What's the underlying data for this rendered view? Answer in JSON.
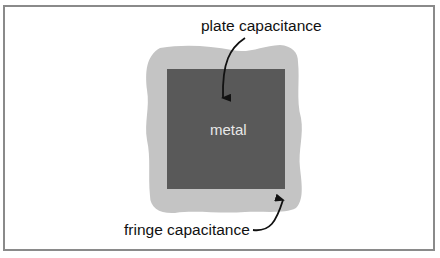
{
  "diagram": {
    "labels": {
      "plate": "plate capacitance",
      "fringe": "fringe capacitance",
      "metal": "metal"
    },
    "colors": {
      "fringe_region": "#c4c4c4",
      "metal_plate": "#595959",
      "frame_border": "#8a8a8a",
      "arrow": "#111111",
      "metal_text": "#e8e8e8"
    }
  }
}
